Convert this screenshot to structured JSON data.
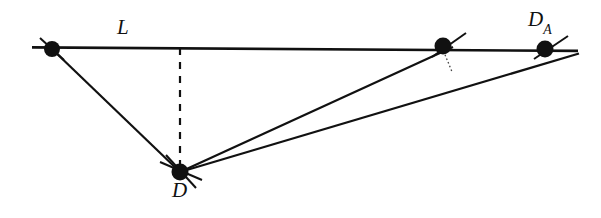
{
  "figure": {
    "title": "",
    "background_color": "#ffffff",
    "stroke_color": "#111111",
    "width": 601,
    "height": 218
  },
  "labels": {
    "line_label": "L",
    "apex_label": "D",
    "right_point_label": "D",
    "right_point_subscript": "A"
  },
  "points": [
    {
      "name": "left-endpoint",
      "label": "",
      "x": 52,
      "y": 49
    },
    {
      "name": "foot-of-perpendicular-top",
      "label": "",
      "x": 180,
      "y": 49
    },
    {
      "name": "projection-point",
      "label": "",
      "x": 443,
      "y": 45
    },
    {
      "name": "point-DA",
      "label": "D_A",
      "x": 545,
      "y": 49
    },
    {
      "name": "point-D",
      "label": "D",
      "x": 180,
      "y": 172
    }
  ],
  "segments": [
    {
      "name": "line-L",
      "style": "solid",
      "from": [
        32,
        47.4
      ],
      "to": [
        578,
        50.9
      ]
    },
    {
      "name": "segment-left-to-D",
      "style": "solid",
      "from": [
        52,
        49
      ],
      "to": [
        180,
        172
      ]
    },
    {
      "name": "segment-D-to-projection",
      "style": "solid",
      "from": [
        180,
        172
      ],
      "to": [
        452,
        48
      ]
    },
    {
      "name": "segment-D-to-DA",
      "style": "solid",
      "from": [
        180,
        172
      ],
      "to": [
        578,
        53
      ]
    },
    {
      "name": "dashed-altitude",
      "style": "dashed",
      "from": [
        180,
        49
      ],
      "to": [
        180,
        170
      ]
    },
    {
      "name": "dotted-right-angle-marker",
      "style": "dotted",
      "from": [
        443,
        52
      ],
      "to": [
        452,
        73
      ]
    }
  ],
  "tick_marks": [
    {
      "name": "tick-left-endpoint",
      "cx": 52,
      "cy": 49,
      "angle_deg": 38
    },
    {
      "name": "tick-projection-point",
      "cx": 443,
      "cy": 45,
      "angle_deg": -27
    },
    {
      "name": "tick-point-DA",
      "cx": 545,
      "cy": 49,
      "angle_deg": -27
    },
    {
      "name": "tick-point-D-a",
      "cx": 180,
      "cy": 172,
      "angle_deg": 22
    },
    {
      "name": "tick-point-D-b",
      "cx": 180,
      "cy": 172,
      "angle_deg": -52
    }
  ]
}
